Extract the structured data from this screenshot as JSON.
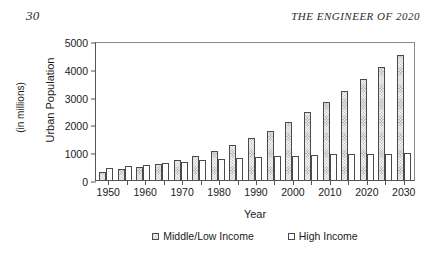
{
  "page": {
    "folio": "30",
    "running_head": "THE ENGINEER OF 2020"
  },
  "chart_data": {
    "type": "bar",
    "title": "",
    "xlabel": "Year",
    "ylabel": "Urban Population",
    "ylabel_units": "(in millions)",
    "ylim": [
      0,
      5000
    ],
    "ytick_values": [
      0,
      1000,
      2000,
      3000,
      4000,
      5000
    ],
    "ytick_labels": [
      "0",
      "1000",
      "2000",
      "3000",
      "4000",
      "5000"
    ],
    "grid": false,
    "legend_position": "bottom",
    "categories": [
      "1950",
      "1955",
      "1960",
      "1965",
      "1970",
      "1975",
      "1980",
      "1985",
      "1990",
      "1995",
      "2000",
      "2005",
      "2010",
      "2015",
      "2020",
      "2025",
      "2030"
    ],
    "xtick_labels": [
      "1950",
      "1960",
      "1970",
      "1980",
      "1990",
      "2000",
      "2010",
      "2020",
      "2030"
    ],
    "series": [
      {
        "name": "Middle/Low Income",
        "color": "#b9b9b9",
        "values": [
          300,
          400,
          470,
          580,
          710,
          850,
          1040,
          1260,
          1510,
          1780,
          2080,
          2440,
          2820,
          3210,
          3620,
          4080,
          4500
        ]
      },
      {
        "name": "High Income",
        "color": "#ffffff",
        "values": [
          450,
          500,
          550,
          600,
          650,
          730,
          770,
          790,
          830,
          860,
          865,
          890,
          925,
          925,
          935,
          940,
          960
        ]
      }
    ]
  }
}
